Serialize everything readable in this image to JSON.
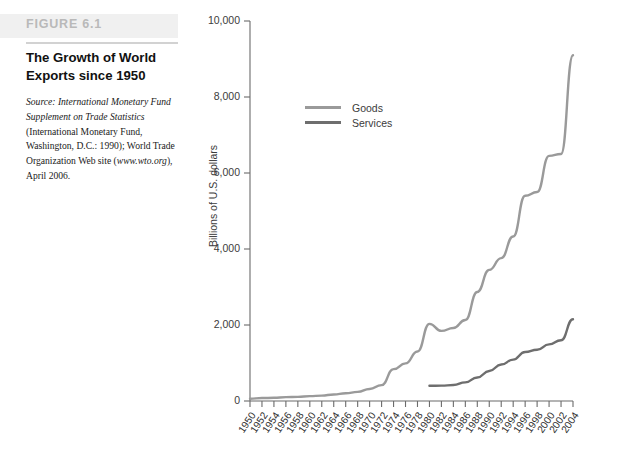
{
  "figure": {
    "number": "FIGURE 6.1",
    "title": "The Growth of World Exports since 1950",
    "source_italic_1": "Source: International Monetary Fund Supplement on Trade Statistics",
    "source_rest_1": " (International Monetary Fund, Washington, D.C.: 1990); World Trade Organization Web site (",
    "source_italic_2": "www.wto.org",
    "source_rest_2": "), April 2006."
  },
  "colors": {
    "goods_line": "#9a9a9a",
    "services_line": "#6e6e6e",
    "axis": "#6b6b6b",
    "text": "#2d2d2d",
    "figure_band": "#f0f0f0",
    "figure_number_text": "#b9b9b9",
    "rule": "#d2d2d2"
  },
  "chart_data": {
    "type": "line",
    "title": "The Growth of World Exports since 1950",
    "xlabel": "",
    "ylabel": "Billions of U.S. dollars",
    "xlim": [
      1950,
      2004
    ],
    "ylim": [
      0,
      10000
    ],
    "ytick_values": [
      0,
      2000,
      4000,
      6000,
      8000,
      10000
    ],
    "ytick_labels": [
      "0",
      "2,000",
      "4,000",
      "6,000",
      "8,000",
      "10,000"
    ],
    "grid": false,
    "legend_position": "upper-left-inside",
    "categories": [
      1950,
      1952,
      1954,
      1956,
      1958,
      1960,
      1962,
      1964,
      1966,
      1968,
      1970,
      1972,
      1974,
      1976,
      1978,
      1980,
      1982,
      1984,
      1986,
      1988,
      1990,
      1992,
      1994,
      1996,
      1998,
      2000,
      2002,
      2004
    ],
    "xtick_labels": [
      "1950",
      "1952",
      "1954",
      "1956",
      "1958",
      "1960",
      "1962",
      "1964",
      "1966",
      "1968",
      "1970",
      "1972",
      "1974",
      "1976",
      "1978",
      "1980",
      "1982",
      "1984",
      "1986",
      "1988",
      "1990",
      "1992",
      "1994",
      "1996",
      "1998",
      "2000",
      "2002",
      "2004"
    ],
    "series": [
      {
        "name": "Goods",
        "color": "#9a9a9a",
        "x": [
          1950,
          1952,
          1954,
          1956,
          1958,
          1960,
          1962,
          1964,
          1966,
          1968,
          1970,
          1972,
          1974,
          1976,
          1978,
          1980,
          1982,
          1984,
          1986,
          1988,
          1990,
          1992,
          1994,
          1996,
          1998,
          2000,
          2002,
          2004
        ],
        "values": [
          61,
          77,
          84,
          103,
          108,
          128,
          141,
          172,
          204,
          240,
          315,
          417,
          838,
          990,
          1303,
          2030,
          1845,
          1920,
          2130,
          2870,
          3450,
          3760,
          4330,
          5400,
          5500,
          6450,
          6500,
          9100
        ]
      },
      {
        "name": "Services",
        "color": "#6e6e6e",
        "x": [
          1980,
          1982,
          1984,
          1986,
          1988,
          1990,
          1992,
          1994,
          1996,
          1998,
          2000,
          2002,
          2004
        ],
        "values": [
          400,
          405,
          420,
          490,
          620,
          790,
          960,
          1090,
          1290,
          1350,
          1490,
          1600,
          2150
        ]
      }
    ]
  },
  "legend": {
    "items": [
      {
        "label": "Goods",
        "color": "#9a9a9a"
      },
      {
        "label": "Services",
        "color": "#6e6e6e"
      }
    ]
  }
}
